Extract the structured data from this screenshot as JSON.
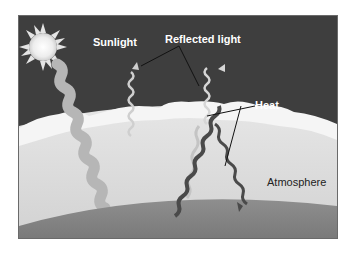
{
  "diagram": {
    "labels": {
      "sunlight": "Sunlight",
      "reflected_light": "Reflected light",
      "heat": "Heat",
      "atmosphere": "Atmosphere"
    },
    "colors": {
      "sky": "#3e3e3e",
      "sun": "#f2f2f2",
      "clouds": "#f4f4f4",
      "atmosphere": "#dcdcdc",
      "earth": "#8a8a8a",
      "sunlight_beam": "#b8b8b8",
      "heat_wave": "#4a4a4a",
      "reflected_wave": "#cfcfcf"
    }
  }
}
